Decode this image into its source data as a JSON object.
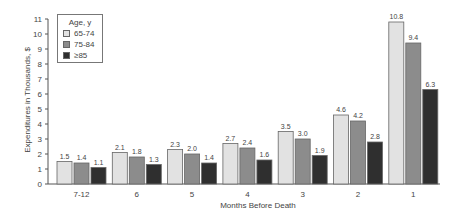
{
  "chart_data": {
    "type": "bar",
    "title": "",
    "xlabel": "Months Before Death",
    "ylabel": "Expenditures in Thousands, $",
    "ylim": [
      0,
      11
    ],
    "yticks": [
      0,
      1,
      2,
      3,
      4,
      5,
      6,
      7,
      8,
      9,
      10,
      11
    ],
    "grid": false,
    "legend_position": "top-left",
    "legend_title": "Age, y",
    "categories": [
      "7-12",
      "6",
      "5",
      "4",
      "3",
      "2",
      "1"
    ],
    "series": [
      {
        "name": "65-74",
        "color": "#e2e2e2",
        "values": [
          1.5,
          2.1,
          2.3,
          2.7,
          3.5,
          4.6,
          10.8
        ],
        "labels": [
          "1.5",
          "2.1",
          "2.3",
          "2.7",
          "3.5",
          "4.6",
          "10.8"
        ]
      },
      {
        "name": "75-84",
        "color": "#8c8c8c",
        "values": [
          1.4,
          1.8,
          2.0,
          2.4,
          3.0,
          4.2,
          9.4
        ],
        "labels": [
          "1.4",
          "1.8",
          "2.0",
          "2.4",
          "3.0",
          "4.2",
          "9.4"
        ]
      },
      {
        "name": "≥85",
        "color": "#2f2f2f",
        "values": [
          1.1,
          1.3,
          1.4,
          1.6,
          1.9,
          2.8,
          6.3
        ],
        "labels": [
          "1.1",
          "1.3",
          "1.4",
          "1.6",
          "1.9",
          "2.8",
          "6.3"
        ]
      }
    ]
  }
}
